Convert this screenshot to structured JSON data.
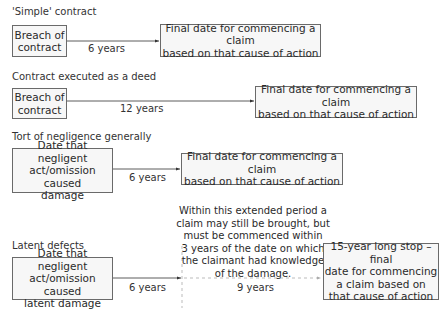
{
  "diagram": {
    "sections": [
      {
        "title": "'Simple' contract",
        "start_box": "Breach of\ncontract",
        "start_lines": [
          "Breach of",
          "contract"
        ],
        "duration": "6 years",
        "end_lines": [
          "Final date for commencing a claim",
          "based on that cause of action"
        ]
      },
      {
        "title": "Contract executed as a deed",
        "start_lines": [
          "Breach of",
          "contract"
        ],
        "duration": "12 years",
        "end_lines": [
          "Final date for commencing a claim",
          "based on that cause of action"
        ]
      },
      {
        "title": "Tort of negligence generally",
        "start_lines": [
          "Date that negligent",
          "act/omission caused",
          "damage"
        ],
        "duration": "6 years",
        "end_lines": [
          "Final date for commencing a claim",
          "based on that cause of action"
        ]
      },
      {
        "title": "Latent defects",
        "start_lines": [
          "Date that negligent",
          "act/omission caused",
          "latent damage"
        ],
        "duration": "6 years",
        "extended_duration": "9 years",
        "note_lines": [
          "Within this extended period a",
          "claim may still be brought, but",
          "must be commenced within",
          "3 years of the date on which",
          "the claimant had knowledge",
          "of the damage."
        ],
        "end_lines": [
          "15-year long stop – final",
          "date for commencing",
          "a claim based on",
          "that cause of action"
        ]
      }
    ],
    "colors": {
      "box_border": "#6a6a6a",
      "box_fill": "#f7f7f7",
      "line": "#333333",
      "dashed_line": "#aaaaaa"
    }
  }
}
